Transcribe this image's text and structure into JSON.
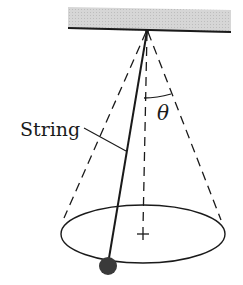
{
  "diagram": {
    "labels": {
      "string": "String",
      "angle": "θ"
    },
    "colors": {
      "ceiling_fill": "#d4d4d4",
      "line": "#1a1a1a",
      "bob": "#3a3a3a",
      "background": "#ffffff"
    },
    "geometry": {
      "ceiling": {
        "x": 68,
        "y": 7,
        "width": 163,
        "height": 24
      },
      "apex": {
        "x": 147,
        "y": 30
      },
      "ellipse": {
        "cx": 143,
        "cy": 234,
        "rx": 82,
        "ry": 29
      },
      "bob": {
        "cx": 108,
        "cy": 266,
        "r": 9
      },
      "axis_end": {
        "x": 143,
        "y": 234
      }
    }
  }
}
